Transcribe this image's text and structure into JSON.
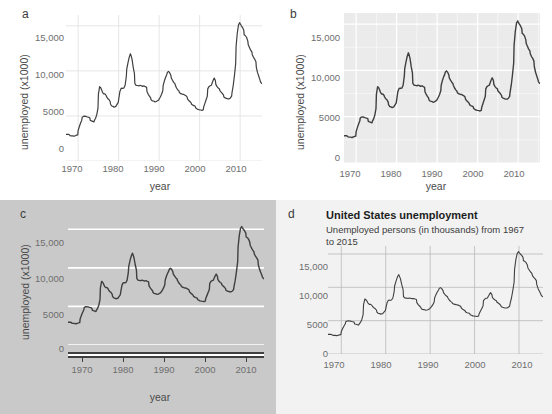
{
  "figure": {
    "panels": [
      "a",
      "b",
      "c",
      "d"
    ]
  },
  "panel_a": {
    "letter": "a",
    "ylabel": "unemployed (x1000)",
    "xlabel": "year"
  },
  "panel_b": {
    "letter": "b",
    "ylabel": "unemployed (x1000)",
    "xlabel": "year"
  },
  "panel_c": {
    "letter": "c",
    "ylabel": "unemployed (x1000)",
    "xlabel": "year"
  },
  "panel_d": {
    "letter": "d",
    "title": "United States unemployment",
    "subtitle": "Unemployed persons (in thousands) from 1967 to 2015",
    "ylabel": "",
    "xlabel": ""
  },
  "ticks": {
    "y_labels": [
      "0",
      "5000",
      "10,000",
      "15,000"
    ],
    "y_values": [
      0,
      5000,
      10000,
      15000
    ],
    "x_labels": [
      "1970",
      "1980",
      "1990",
      "2000",
      "2010"
    ],
    "x_values": [
      1970,
      1980,
      1990,
      2000,
      2010
    ]
  },
  "colors": {
    "line": "#3f3f3f",
    "panel_a_bg": "#ffffff",
    "panel_a_grid": "#e3e3e3",
    "panel_b_bg": "#ebebeb",
    "panel_b_grid_major": "#ffffff",
    "panel_b_grid_minor": "#f7f7f7",
    "panel_c_bg": "#c9c9c9",
    "panel_c_grid": "#ffffff",
    "panel_c_axis": "#3f3f3f",
    "panel_d_bg": "#f2f2f2",
    "panel_d_grid": "#b9b9b9",
    "tick_text": "#6e6e6e",
    "axis_title": "#4a4a4a"
  },
  "chart_data": {
    "type": "line",
    "title": "United States unemployment",
    "subtitle": "Unemployed persons (in thousands) from 1967 to 2015",
    "xlabel": "year",
    "ylabel": "unemployed (x1000)",
    "xlim": [
      1967.0,
      2015.4
    ],
    "ylim": [
      0,
      16200
    ],
    "grid": true,
    "legend": "none",
    "series": [
      {
        "name": "unemployed",
        "x": [
          1967.0,
          1967.3,
          1967.6,
          1967.9,
          1968.0,
          1968.3,
          1968.6,
          1968.9,
          1969.0,
          1969.3,
          1969.6,
          1969.9,
          1970.0,
          1970.3,
          1970.6,
          1970.9,
          1971.0,
          1971.3,
          1971.6,
          1971.9,
          1972.0,
          1972.3,
          1972.6,
          1972.9,
          1973.0,
          1973.3,
          1973.6,
          1973.9,
          1974.0,
          1974.3,
          1974.6,
          1974.9,
          1975.0,
          1975.3,
          1975.6,
          1975.9,
          1976.0,
          1976.3,
          1976.6,
          1976.9,
          1977.0,
          1977.3,
          1977.6,
          1977.9,
          1978.0,
          1978.3,
          1978.6,
          1978.9,
          1979.0,
          1979.3,
          1979.6,
          1979.9,
          1980.0,
          1980.3,
          1980.6,
          1980.9,
          1981.0,
          1981.3,
          1981.6,
          1981.9,
          1982.0,
          1982.3,
          1982.6,
          1982.9,
          1983.0,
          1983.3,
          1983.6,
          1983.9,
          1984.0,
          1984.3,
          1984.6,
          1984.9,
          1985.0,
          1985.3,
          1985.6,
          1985.9,
          1986.0,
          1986.3,
          1986.6,
          1986.9,
          1987.0,
          1987.3,
          1987.6,
          1987.9,
          1988.0,
          1988.3,
          1988.6,
          1988.9,
          1989.0,
          1989.3,
          1989.6,
          1989.9,
          1990.0,
          1990.3,
          1990.6,
          1990.9,
          1991.0,
          1991.3,
          1991.6,
          1991.9,
          1992.0,
          1992.3,
          1992.6,
          1992.9,
          1993.0,
          1993.3,
          1993.6,
          1993.9,
          1994.0,
          1994.3,
          1994.6,
          1994.9,
          1995.0,
          1995.3,
          1995.6,
          1995.9,
          1996.0,
          1996.3,
          1996.6,
          1996.9,
          1997.0,
          1997.3,
          1997.6,
          1997.9,
          1998.0,
          1998.3,
          1998.6,
          1998.9,
          1999.0,
          1999.3,
          1999.6,
          1999.9,
          2000.0,
          2000.3,
          2000.6,
          2000.9,
          2001.0,
          2001.3,
          2001.6,
          2001.9,
          2002.0,
          2002.3,
          2002.6,
          2002.9,
          2003.0,
          2003.3,
          2003.6,
          2003.9,
          2004.0,
          2004.3,
          2004.6,
          2004.9,
          2005.0,
          2005.3,
          2005.6,
          2005.9,
          2006.0,
          2006.3,
          2006.6,
          2006.9,
          2007.0,
          2007.3,
          2007.6,
          2007.9,
          2008.0,
          2008.3,
          2008.6,
          2008.9,
          2009.0,
          2009.3,
          2009.6,
          2009.9,
          2010.0,
          2010.3,
          2010.6,
          2010.9,
          2011.0,
          2011.3,
          2011.6,
          2011.9,
          2012.0,
          2012.3,
          2012.6,
          2012.9,
          2013.0,
          2013.3,
          2013.6,
          2013.9,
          2014.0,
          2014.3,
          2014.6,
          2014.9,
          2015.0,
          2015.3
        ],
        "y": [
          2944,
          2945,
          2958,
          2883,
          2820,
          2797,
          2795,
          2760,
          2754,
          2810,
          2867,
          2903,
          3386,
          3822,
          4210,
          4532,
          4850,
          4951,
          4979,
          4943,
          4932,
          4880,
          4843,
          4759,
          4508,
          4452,
          4400,
          4337,
          4490,
          4740,
          5150,
          5870,
          7400,
          8250,
          8100,
          7780,
          7630,
          7440,
          7450,
          7290,
          7140,
          6940,
          6820,
          6600,
          6300,
          6100,
          6060,
          5980,
          6000,
          6060,
          6280,
          6500,
          6800,
          7700,
          8050,
          8080,
          8050,
          8100,
          8400,
          9400,
          10200,
          10900,
          11500,
          11900,
          11800,
          11300,
          10400,
          9700,
          8600,
          8400,
          8380,
          8350,
          8330,
          8400,
          8350,
          8280,
          8310,
          8330,
          8250,
          8180,
          7700,
          7400,
          7200,
          7000,
          6800,
          6680,
          6660,
          6590,
          6560,
          6600,
          6680,
          6780,
          6880,
          7100,
          7400,
          7800,
          8400,
          8900,
          9300,
          9600,
          9800,
          9950,
          9800,
          9500,
          9200,
          8950,
          8730,
          8580,
          8400,
          8100,
          7900,
          7750,
          7600,
          7480,
          7440,
          7380,
          7400,
          7330,
          7250,
          7120,
          6900,
          6720,
          6600,
          6450,
          6300,
          6200,
          6150,
          6080,
          5900,
          5800,
          5720,
          5690,
          5680,
          5660,
          5620,
          5690,
          6000,
          6400,
          6800,
          7200,
          8000,
          8250,
          8350,
          8400,
          8550,
          8900,
          9200,
          8900,
          8500,
          8250,
          8100,
          8000,
          7800,
          7650,
          7500,
          7300,
          7100,
          7000,
          6950,
          6900,
          6900,
          6900,
          7000,
          7200,
          7600,
          8400,
          9500,
          10800,
          12700,
          14200,
          15100,
          15350,
          15250,
          15000,
          14800,
          14500,
          14000,
          13900,
          13700,
          13300,
          12900,
          12600,
          12300,
          12100,
          11800,
          11500,
          11300,
          11000,
          10400,
          9800,
          9400,
          9000,
          8800,
          8600
        ]
      }
    ]
  }
}
